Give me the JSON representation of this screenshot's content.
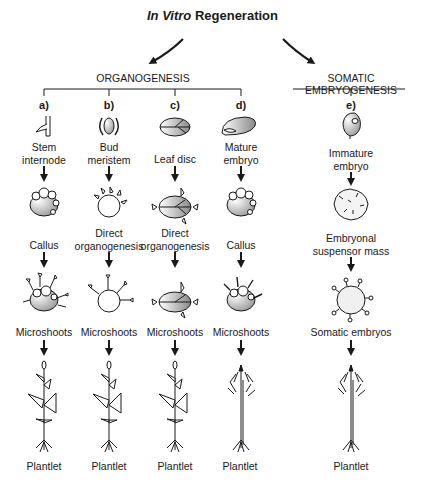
{
  "title": {
    "italic": "In Vitro",
    "rest": " Regeneration"
  },
  "branches": {
    "organogenesis": "ORGANOGENESIS",
    "somatic": "SOMATIC EMBRYOGENESIS"
  },
  "columns": [
    {
      "letter": "a)",
      "x": 44,
      "explant": "Stem internode",
      "stage2": "Callus",
      "stage3": "Microshoots",
      "final": "Plantlet",
      "plant_type": "dicot"
    },
    {
      "letter": "b)",
      "x": 109,
      "explant": "Bud meristem",
      "stage2": "Direct organogenesis",
      "stage3": "Microshoots",
      "final": "Plantlet",
      "plant_type": "dicot"
    },
    {
      "letter": "c)",
      "x": 175,
      "explant": "Leaf disc",
      "stage2": "Direct organogenesis",
      "stage3": "Microshoots",
      "final": "Plantlet",
      "plant_type": "dicot"
    },
    {
      "letter": "d)",
      "x": 241,
      "explant": "Mature embryo",
      "stage2": "Callus",
      "stage3": "Microshoots",
      "final": "Plantlet",
      "plant_type": "monocot"
    },
    {
      "letter": "e)",
      "x": 351,
      "explant": "Immature embryo",
      "stage2": "Embryonal suspensor mass",
      "stage3": "Somatic embryos",
      "final": "Plantlet",
      "plant_type": "conifer"
    }
  ],
  "labels": {
    "a_explant_1": "Stem",
    "a_explant_2": "internode",
    "b_explant_1": "Bud",
    "b_explant_2": "meristem",
    "c_explant_1": "Leaf disc",
    "d_explant_1": "Mature",
    "d_explant_2": "embryo",
    "e_explant_1": "Immature",
    "e_explant_2": "embryo",
    "a_stage2": "Callus",
    "b_stage2_1": "Direct",
    "b_stage2_2": "organogenesis",
    "c_stage2_1": "Direct",
    "c_stage2_2": "organogenesis",
    "d_stage2": "Callus",
    "e_stage2_1": "Embryonal",
    "e_stage2_2": "suspensor mass",
    "a_stage3": "Microshoots",
    "b_stage3": "Microshoots",
    "c_stage3": "Microshoots",
    "d_stage3": "Microshoots",
    "e_stage3": "Somatic embryos",
    "a_final": "Plantlet",
    "b_final": "Plantlet",
    "c_final": "Plantlet",
    "d_final": "Plantlet",
    "e_final": "Plantlet"
  },
  "colors": {
    "ink": "#1a1a1a",
    "shade": "#9a9a9a"
  }
}
